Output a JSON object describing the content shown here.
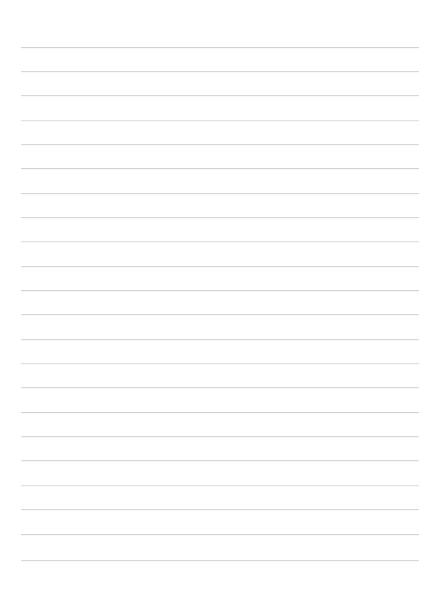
{
  "page": {
    "kind": "blank-lined-paper",
    "width": 440,
    "height": 589,
    "background_color": "#ffffff",
    "has_text": false,
    "has_header": false,
    "has_margin_rule": false,
    "has_holes": false,
    "has_watermark": false
  },
  "ruling": {
    "line_color": "#d8d8da",
    "line_thickness_px": 1,
    "line_count": 22,
    "line_spacing_px": 24.4,
    "first_line_y": 47,
    "last_line_y": 560,
    "line_start_x": 21,
    "line_end_x": 419,
    "top_margin_px": 47,
    "bottom_margin_px": 29,
    "left_margin_px": 21,
    "right_margin_px": 21,
    "lines": [
      {
        "index": 1,
        "y": 47,
        "tone": "dark"
      },
      {
        "index": 2,
        "y": 71,
        "tone": "normal"
      },
      {
        "index": 3,
        "y": 95,
        "tone": "normal"
      },
      {
        "index": 4,
        "y": 120,
        "tone": "faint"
      },
      {
        "index": 5,
        "y": 144,
        "tone": "normal"
      },
      {
        "index": 6,
        "y": 168,
        "tone": "dark"
      },
      {
        "index": 7,
        "y": 193,
        "tone": "normal"
      },
      {
        "index": 8,
        "y": 217,
        "tone": "normal"
      },
      {
        "index": 9,
        "y": 241,
        "tone": "faint"
      },
      {
        "index": 10,
        "y": 266,
        "tone": "normal"
      },
      {
        "index": 11,
        "y": 290,
        "tone": "dark"
      },
      {
        "index": 12,
        "y": 314,
        "tone": "normal"
      },
      {
        "index": 13,
        "y": 339,
        "tone": "normal"
      },
      {
        "index": 14,
        "y": 363,
        "tone": "faint"
      },
      {
        "index": 15,
        "y": 387,
        "tone": "normal"
      },
      {
        "index": 16,
        "y": 412,
        "tone": "dark"
      },
      {
        "index": 17,
        "y": 436,
        "tone": "normal"
      },
      {
        "index": 18,
        "y": 460,
        "tone": "normal"
      },
      {
        "index": 19,
        "y": 485,
        "tone": "faint"
      },
      {
        "index": 20,
        "y": 509,
        "tone": "normal"
      },
      {
        "index": 21,
        "y": 534,
        "tone": "dark"
      },
      {
        "index": 22,
        "y": 560,
        "tone": "normal"
      }
    ]
  },
  "content": {
    "written_text": [],
    "notes_placeholder": ""
  }
}
